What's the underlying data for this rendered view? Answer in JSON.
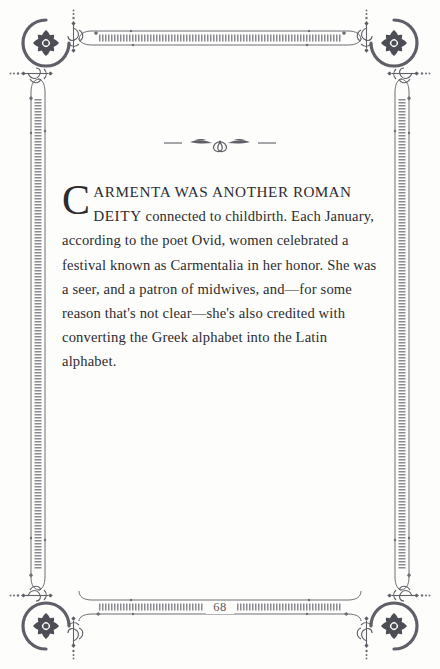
{
  "page": {
    "background_color": "#fdfdfb",
    "ink_color": "#2c2c30",
    "ornament_color": "#6e6e76",
    "number": "68"
  },
  "ornaments": {
    "corner_rosette": "rosette-corner-ornament",
    "divider": "floral-divider-ornament",
    "divider_glyph": "—❦—"
  },
  "content": {
    "dropcap": "C",
    "opening_smallcaps": "ARMENTA WAS ANOTHER ",
    "opening_name": "ROMAN",
    "opening_smallcaps2": " DEITY",
    "paragraph": " connected to childbirth. Each January, according to the poet Ovid, women celebrated a festival known as Carmentalia in her honor. She was a seer, and a patron of midwives, and—for some reason that's not clear—she's also credited with converting the Greek alphabet into the Latin alphabet."
  }
}
